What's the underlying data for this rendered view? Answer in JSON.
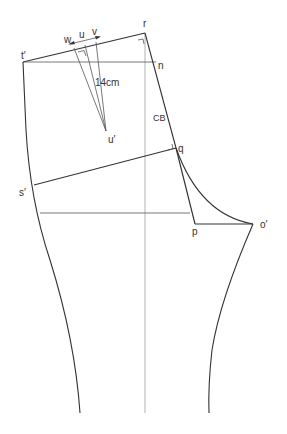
{
  "diagram": {
    "type": "pattern-draft",
    "labels": {
      "r": "r",
      "t_prime": "t′",
      "n": "n",
      "w": "w",
      "u": "u",
      "v": "v",
      "u_prime": "u′",
      "dart_length": "14cm",
      "cb": "CB",
      "q": "q",
      "s_prime": "s′",
      "p": "p",
      "o_prime": "o′"
    },
    "points": {
      "r": [
        145,
        33
      ],
      "t_prime": [
        23,
        62
      ],
      "n": [
        156,
        62
      ],
      "w": [
        74,
        48
      ],
      "u": [
        85,
        45
      ],
      "v": [
        96,
        42
      ],
      "u_prime": [
        106,
        131
      ],
      "q": [
        176,
        148
      ],
      "s_prime": [
        34,
        185
      ],
      "hip_left": [
        40,
        213
      ],
      "hip_right": [
        190,
        213
      ],
      "p": [
        195,
        224
      ],
      "o_prime": [
        253,
        224
      ],
      "hem_left": [
        80,
        413
      ],
      "hem_right": [
        209,
        413
      ],
      "grain_top": [
        145,
        33
      ],
      "grain_bottom": [
        145,
        413
      ]
    },
    "colors": {
      "line": "#333333",
      "guide": "#aaaaaa",
      "text": "#333333",
      "background": "#ffffff"
    }
  }
}
